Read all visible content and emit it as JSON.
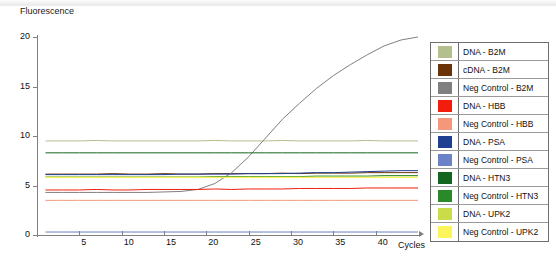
{
  "chart_data": {
    "type": "line",
    "title": "",
    "ylabel": "Fluorescence",
    "xlabel": "Cycles",
    "xlim": [
      0,
      45
    ],
    "ylim": [
      0,
      20
    ],
    "xticks": [
      5,
      10,
      15,
      20,
      25,
      30,
      35,
      40
    ],
    "yticks": [
      0,
      5,
      10,
      15,
      20
    ],
    "grid": false,
    "legend_position": "right",
    "x": [
      1,
      3,
      5,
      7,
      9,
      11,
      13,
      15,
      17,
      19,
      21,
      23,
      25,
      27,
      29,
      31,
      33,
      35,
      37,
      39,
      41,
      43,
      45
    ],
    "series": [
      {
        "name": "DNA - B2M",
        "color": "#b4bf8e",
        "values": [
          9.5,
          9.5,
          9.5,
          9.55,
          9.5,
          9.5,
          9.5,
          9.5,
          9.5,
          9.5,
          9.55,
          9.5,
          9.5,
          9.5,
          9.55,
          9.5,
          9.5,
          9.5,
          9.5,
          9.55,
          9.5,
          9.5,
          9.5
        ]
      },
      {
        "name": "cDNA - B2M",
        "color": "#6b3408",
        "values": [
          6.15,
          6.15,
          6.15,
          6.15,
          6.2,
          6.15,
          6.15,
          6.2,
          6.15,
          6.15,
          6.2,
          6.2,
          6.2,
          6.2,
          6.25,
          6.2,
          6.25,
          6.25,
          6.25,
          6.3,
          6.3,
          6.3,
          6.3
        ]
      },
      {
        "name": "Neg Control - B2M",
        "color": "#808080",
        "values": [
          4.3,
          4.3,
          4.3,
          4.3,
          4.3,
          4.3,
          4.3,
          4.35,
          4.4,
          4.6,
          5.2,
          6.3,
          7.9,
          9.8,
          11.7,
          13.3,
          14.8,
          16.1,
          17.2,
          18.2,
          19.1,
          19.7,
          20.0
        ]
      },
      {
        "name": "DNA - HBB",
        "color": "#f21d0d",
        "values": [
          4.55,
          4.55,
          4.55,
          4.6,
          4.55,
          4.55,
          4.6,
          4.6,
          4.6,
          4.6,
          4.65,
          4.6,
          4.65,
          4.65,
          4.65,
          4.7,
          4.7,
          4.7,
          4.7,
          4.75,
          4.75,
          4.75,
          4.75
        ]
      },
      {
        "name": "Neg Control - HBB",
        "color": "#f4977b",
        "values": [
          3.5,
          3.5,
          3.5,
          3.5,
          3.5,
          3.5,
          3.5,
          3.5,
          3.5,
          3.5,
          3.5,
          3.5,
          3.5,
          3.5,
          3.5,
          3.5,
          3.5,
          3.5,
          3.5,
          3.5,
          3.5,
          3.5,
          3.5
        ]
      },
      {
        "name": "DNA - PSA",
        "color": "#1f3f91",
        "values": [
          6.1,
          6.1,
          6.1,
          6.1,
          6.1,
          6.1,
          6.1,
          6.1,
          6.15,
          6.15,
          6.15,
          6.15,
          6.2,
          6.2,
          6.2,
          6.25,
          6.3,
          6.3,
          6.35,
          6.4,
          6.45,
          6.5,
          6.5
        ]
      },
      {
        "name": "Neg Control - PSA",
        "color": "#6b82c6",
        "values": [
          0.3,
          0.3,
          0.3,
          0.3,
          0.3,
          0.3,
          0.3,
          0.3,
          0.3,
          0.3,
          0.3,
          0.3,
          0.3,
          0.3,
          0.3,
          0.3,
          0.3,
          0.3,
          0.3,
          0.3,
          0.3,
          0.3,
          0.3
        ]
      },
      {
        "name": "DNA - HTN3",
        "color": "#12661f",
        "values": [
          8.3,
          8.3,
          8.3,
          8.3,
          8.3,
          8.3,
          8.3,
          8.3,
          8.3,
          8.3,
          8.3,
          8.3,
          8.3,
          8.3,
          8.3,
          8.3,
          8.3,
          8.3,
          8.3,
          8.3,
          8.3,
          8.3,
          8.3
        ]
      },
      {
        "name": "Neg Control - HTN3",
        "color": "#2a8a2a",
        "values": [
          5.85,
          5.85,
          5.85,
          5.85,
          5.85,
          5.85,
          5.85,
          5.85,
          5.85,
          5.85,
          5.9,
          5.9,
          5.9,
          5.9,
          5.9,
          5.9,
          5.95,
          5.95,
          5.95,
          5.95,
          6.0,
          6.0,
          6.0
        ]
      },
      {
        "name": "DNA - UPK2",
        "color": "#cbdc4a",
        "values": [
          5.85,
          5.85,
          5.85,
          5.85,
          5.85,
          5.85,
          5.85,
          5.85,
          5.85,
          5.85,
          5.85,
          5.85,
          5.85,
          5.85,
          5.85,
          5.85,
          5.85,
          5.85,
          5.85,
          5.85,
          5.85,
          5.85,
          5.85
        ]
      },
      {
        "name": "Neg Control - UPK2",
        "color": "#fbf55a",
        "values": [
          5.8,
          5.8,
          5.8,
          5.8,
          5.8,
          5.8,
          5.8,
          5.8,
          5.8,
          5.8,
          5.8,
          5.8,
          5.8,
          5.8,
          5.8,
          5.8,
          5.8,
          5.8,
          5.8,
          5.8,
          5.8,
          5.8,
          5.8
        ]
      }
    ]
  },
  "axes": {
    "ylabel": "Fluorescence",
    "xlabel": "Cycles",
    "yticks": [
      "20",
      "15",
      "10",
      "5",
      "0"
    ],
    "xticks": [
      "5",
      "10",
      "15",
      "20",
      "25",
      "30",
      "35",
      "40"
    ]
  },
  "legend": {
    "items": [
      {
        "label": "DNA - B2M",
        "color": "#b4bf8e"
      },
      {
        "label": "cDNA - B2M",
        "color": "#6b3408"
      },
      {
        "label": "Neg Control - B2M",
        "color": "#808080"
      },
      {
        "label": "DNA - HBB",
        "color": "#f21d0d"
      },
      {
        "label": "Neg Control - HBB",
        "color": "#f4977b"
      },
      {
        "label": "DNA - PSA",
        "color": "#1f3f91"
      },
      {
        "label": "Neg Control - PSA",
        "color": "#6b82c6"
      },
      {
        "label": "DNA - HTN3",
        "color": "#12661f"
      },
      {
        "label": "Neg Control - HTN3",
        "color": "#2a8a2a"
      },
      {
        "label": "DNA - UPK2",
        "color": "#cbdc4a"
      },
      {
        "label": "Neg Control - UPK2",
        "color": "#fbf55a"
      }
    ]
  }
}
